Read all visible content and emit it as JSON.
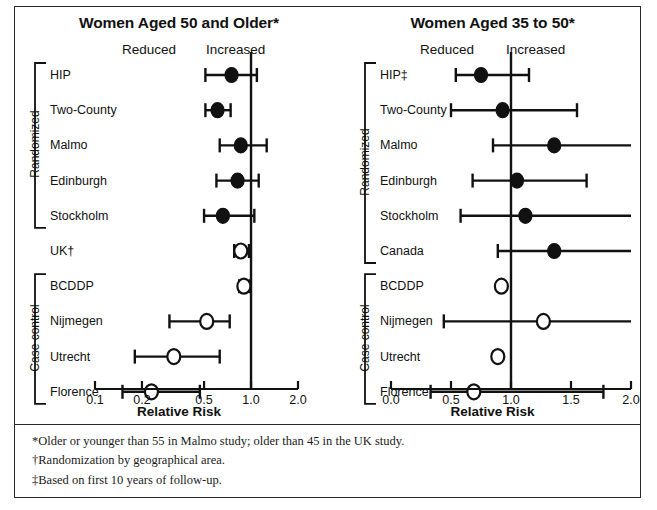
{
  "figure": {
    "background": "#ffffff",
    "ink": "#111111"
  },
  "panels": [
    {
      "id": "women-50-and-older",
      "title": "Women Aged 50 and Older*",
      "left_direction_label": "Reduced",
      "right_direction_label": "Increased",
      "axis_title": "Relative Risk",
      "scale": "log",
      "ticks": [
        "0.1",
        "0.2",
        "0.5",
        "1.0",
        "2.0"
      ],
      "tick_values": [
        0.1,
        0.2,
        0.5,
        1.0,
        2.0
      ],
      "reference_line": 1.0,
      "groups": [
        {
          "label": "Randomized",
          "rows": [
            0,
            1,
            2,
            3,
            4
          ]
        },
        {
          "label": "Case control",
          "rows": [
            6,
            7,
            8,
            9
          ]
        }
      ],
      "rows": [
        {
          "label": "HIP",
          "marker": "filled",
          "rr": 0.75,
          "low": 0.51,
          "high": 1.09
        },
        {
          "label": "Two-County",
          "marker": "filled",
          "rr": 0.61,
          "low": 0.51,
          "high": 0.74
        },
        {
          "label": "Malmo",
          "marker": "filled",
          "rr": 0.86,
          "low": 0.63,
          "high": 1.26
        },
        {
          "label": "Edinburgh",
          "marker": "filled",
          "rr": 0.82,
          "low": 0.6,
          "high": 1.12
        },
        {
          "label": "Stockholm",
          "marker": "filled",
          "rr": 0.66,
          "low": 0.5,
          "high": 1.05
        },
        {
          "label": "UK†",
          "marker": "open",
          "rr": 0.86,
          "low": 0.78,
          "high": 0.97
        },
        {
          "label": "BCDDP",
          "marker": "open",
          "rr": 0.9,
          "low": 0.84,
          "high": 0.98
        },
        {
          "label": "Nijmegen",
          "marker": "open",
          "rr": 0.52,
          "low": 0.3,
          "high": 0.73
        },
        {
          "label": "Utrecht",
          "marker": "open",
          "rr": 0.32,
          "low": 0.18,
          "high": 0.63
        },
        {
          "label": "Florence",
          "marker": "open",
          "rr": 0.23,
          "low": 0.15,
          "high": 0.47
        }
      ]
    },
    {
      "id": "women-35-to-50",
      "title": "Women Aged 35 to 50*",
      "left_direction_label": "Reduced",
      "right_direction_label": "Increased",
      "axis_title": "Relative Risk",
      "scale": "linear",
      "ticks": [
        "0.0",
        "0.5",
        "1.0",
        "1.5",
        "2.0"
      ],
      "tick_values": [
        0.0,
        0.5,
        1.0,
        1.5,
        2.0
      ],
      "reference_line": 1.0,
      "groups": [
        {
          "label": "Randomized",
          "rows": [
            0,
            1,
            2,
            3,
            4,
            5
          ]
        },
        {
          "label": "Case control",
          "rows": [
            6,
            7,
            8,
            9
          ]
        }
      ],
      "rows": [
        {
          "label": "HIP‡",
          "marker": "filled",
          "rr": 0.75,
          "low": 0.54,
          "high": 1.15
        },
        {
          "label": "Two-County",
          "marker": "filled",
          "rr": 0.93,
          "low": 0.5,
          "high": 1.55
        },
        {
          "label": "Malmo",
          "marker": "filled",
          "rr": 1.36,
          "low": 0.85,
          "high": 2.0
        },
        {
          "label": "Edinburgh",
          "marker": "filled",
          "rr": 1.05,
          "low": 0.68,
          "high": 1.63
        },
        {
          "label": "Stockholm",
          "marker": "filled",
          "rr": 1.12,
          "low": 0.58,
          "high": 2.0
        },
        {
          "label": "Canada",
          "marker": "filled",
          "rr": 1.36,
          "low": 0.89,
          "high": 2.0
        },
        {
          "label": "BCDDP",
          "marker": "open",
          "rr": 0.92,
          "low": 0.92,
          "high": 0.92
        },
        {
          "label": "Nijmegen",
          "marker": "open",
          "rr": 1.27,
          "low": 0.44,
          "high": 2.0
        },
        {
          "label": "Utrecht",
          "marker": "open",
          "rr": 0.89,
          "low": 0.89,
          "high": 0.89
        },
        {
          "label": "Florence",
          "marker": "open",
          "rr": 0.69,
          "low": 0.33,
          "high": 1.77
        }
      ]
    }
  ],
  "footnotes": [
    "*Older or younger than 55 in Malmo study; older than 45 in the UK study.",
    "†Randomization by geographical area.",
    "‡Based on first 10 years of follow-up."
  ],
  "chart_data": {
    "type": "scatter",
    "xlabel": "Relative Risk",
    "ylabel": "",
    "grid": false,
    "legend": null,
    "annotations": [
      "Reduced",
      "Increased"
    ],
    "panels": [
      {
        "title": "Women Aged 50 and Older*",
        "xlim": [
          0.1,
          2.0
        ],
        "xscale": "log",
        "xticks": [
          0.1,
          0.2,
          0.5,
          1.0,
          2.0
        ],
        "xticklabels": [
          "0.1",
          "0.2",
          "0.5",
          "1.0",
          "2.0"
        ],
        "reference_line": 1.0,
        "categories": [
          "HIP",
          "Two-County",
          "Malmo",
          "Edinburgh",
          "Stockholm",
          "UK†",
          "BCDDP",
          "Nijmegen",
          "Utrecht",
          "Florence"
        ],
        "point_estimates": [
          0.75,
          0.61,
          0.86,
          0.82,
          0.66,
          0.86,
          0.9,
          0.52,
          0.32,
          0.23
        ],
        "ci_low": [
          0.51,
          0.51,
          0.63,
          0.6,
          0.5,
          0.78,
          0.84,
          0.3,
          0.18,
          0.15
        ],
        "ci_high": [
          1.09,
          0.74,
          1.26,
          1.12,
          1.05,
          0.97,
          0.98,
          0.73,
          0.63,
          0.47
        ],
        "marker_style": [
          "filled",
          "filled",
          "filled",
          "filled",
          "filled",
          "open",
          "open",
          "open",
          "open",
          "open"
        ],
        "group_brackets": [
          {
            "label": "Randomized",
            "categories": [
              "HIP",
              "Two-County",
              "Malmo",
              "Edinburgh",
              "Stockholm"
            ]
          },
          {
            "label": "Case control",
            "categories": [
              "BCDDP",
              "Nijmegen",
              "Utrecht",
              "Florence"
            ]
          }
        ]
      },
      {
        "title": "Women Aged 35 to 50*",
        "xlim": [
          0.0,
          2.0
        ],
        "xscale": "linear",
        "xticks": [
          0.0,
          0.5,
          1.0,
          1.5,
          2.0
        ],
        "xticklabels": [
          "0.0",
          "0.5",
          "1.0",
          "1.5",
          "2.0"
        ],
        "reference_line": 1.0,
        "categories": [
          "HIP‡",
          "Two-County",
          "Malmo",
          "Edinburgh",
          "Stockholm",
          "Canada",
          "BCDDP",
          "Nijmegen",
          "Utrecht",
          "Florence"
        ],
        "point_estimates": [
          0.75,
          0.93,
          1.36,
          1.05,
          1.12,
          1.36,
          0.92,
          1.27,
          0.89,
          0.69
        ],
        "ci_low": [
          0.54,
          0.5,
          0.85,
          0.68,
          0.58,
          0.89,
          null,
          0.44,
          null,
          0.33
        ],
        "ci_high": [
          1.15,
          1.55,
          2.0,
          1.63,
          2.0,
          2.0,
          null,
          2.0,
          null,
          1.77
        ],
        "marker_style": [
          "filled",
          "filled",
          "filled",
          "filled",
          "filled",
          "filled",
          "open",
          "open",
          "open",
          "open"
        ],
        "group_brackets": [
          {
            "label": "Randomized",
            "categories": [
              "HIP‡",
              "Two-County",
              "Malmo",
              "Edinburgh",
              "Stockholm",
              "Canada"
            ]
          },
          {
            "label": "Case control",
            "categories": [
              "BCDDP",
              "Nijmegen",
              "Utrecht",
              "Florence"
            ]
          }
        ]
      }
    ]
  }
}
